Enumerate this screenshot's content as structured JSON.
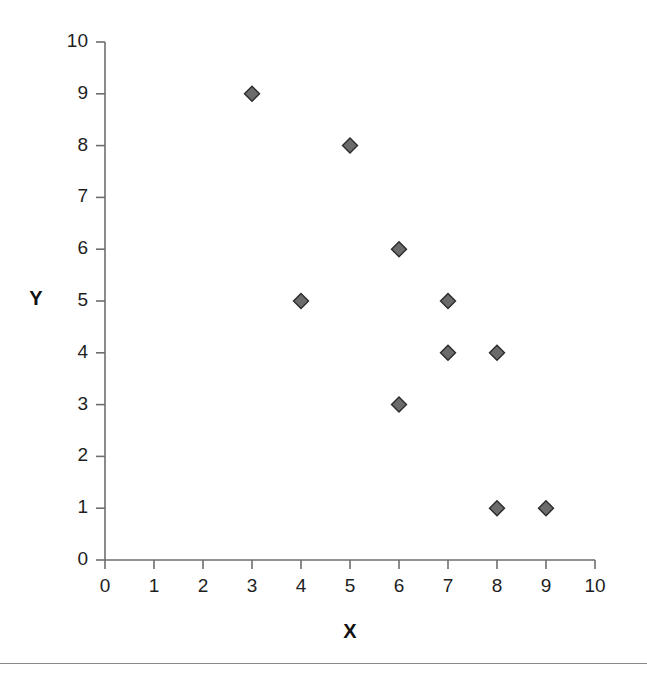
{
  "chart_data": {
    "type": "scatter",
    "title": "",
    "subtitle": "",
    "xlabel": "X",
    "ylabel": "Y",
    "xlim": [
      0,
      10
    ],
    "ylim": [
      0,
      10
    ],
    "xticks": [
      0,
      1,
      2,
      3,
      4,
      5,
      6,
      7,
      8,
      9,
      10
    ],
    "yticks": [
      0,
      1,
      2,
      3,
      4,
      5,
      6,
      7,
      8,
      9,
      10
    ],
    "grid": false,
    "legend": false,
    "legend_position": "none",
    "marker": "diamond",
    "marker_color": "#6b6b6b",
    "marker_edge_color": "#2b2b2b",
    "axis_color": "#6e6e6e",
    "points": [
      {
        "x": 3,
        "y": 9
      },
      {
        "x": 5,
        "y": 8
      },
      {
        "x": 6,
        "y": 6
      },
      {
        "x": 4,
        "y": 5
      },
      {
        "x": 7,
        "y": 5
      },
      {
        "x": 7,
        "y": 4
      },
      {
        "x": 8,
        "y": 4
      },
      {
        "x": 6,
        "y": 3
      },
      {
        "x": 8,
        "y": 1
      },
      {
        "x": 9,
        "y": 1
      }
    ],
    "series": [
      {
        "name": "Series 1",
        "x": [
          3,
          5,
          6,
          4,
          7,
          7,
          8,
          6,
          8,
          9
        ],
        "values": [
          9,
          8,
          6,
          5,
          5,
          4,
          4,
          3,
          1,
          1
        ]
      }
    ]
  },
  "axis": {
    "x_tick_labels": [
      "0",
      "1",
      "2",
      "3",
      "4",
      "5",
      "6",
      "7",
      "8",
      "9",
      "10"
    ],
    "y_tick_labels": [
      "0",
      "1",
      "2",
      "3",
      "4",
      "5",
      "6",
      "7",
      "8",
      "9",
      "10"
    ],
    "x_title": "X",
    "y_title": "Y"
  }
}
